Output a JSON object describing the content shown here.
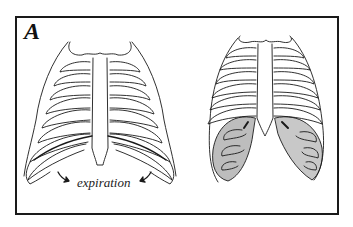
{
  "figure": {
    "panel_label": "A",
    "caption": "expiration",
    "left_drawing": "ribcage during expiration with lower ribs and arrows pointing downward",
    "right_drawing": "ribcage with shaded lower lung/diaphragm regions",
    "colors": {
      "line": "#1a1a1a",
      "shade": "#bdbdbd",
      "background": "#ffffff"
    }
  }
}
